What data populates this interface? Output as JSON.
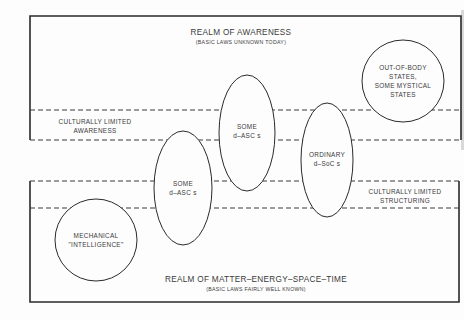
{
  "colors": {
    "background": "#fdfdfd",
    "line": "#2a2a2a",
    "text": "#3a3a3a"
  },
  "realm_awareness": {
    "title": "REALM OF AWARENESS",
    "subtitle": "(BASIC LAWS UNKNOWN TODAY)"
  },
  "realm_matter": {
    "title": "REALM OF MATTER–ENERGY–SPACE–TIME",
    "subtitle": "(BASIC LAWS FAIRLY WELL KNOWN)"
  },
  "band_awareness": {
    "line1": "CULTURALLY LIMITED",
    "line2": "AWARENESS"
  },
  "band_structuring": {
    "line1": "CULTURALLY LIMITED",
    "line2": "STRUCTURING"
  },
  "nodes": {
    "out_of_body": {
      "lines": [
        "OUT-OF-BODY",
        "STATES,",
        "SOME MYSTICAL",
        "STATES"
      ]
    },
    "some_dascs_upper": {
      "lines": [
        "SOME",
        "d–ASC s"
      ]
    },
    "some_dascs_lower": {
      "lines": [
        "SOME",
        "d–ASC s"
      ]
    },
    "ordinary_dsocs": {
      "lines": [
        "ORDINARY",
        "d–SoC s"
      ]
    },
    "mechanical": {
      "lines": [
        "MECHANICAL",
        "\"INTELLIGENCE\""
      ]
    }
  }
}
